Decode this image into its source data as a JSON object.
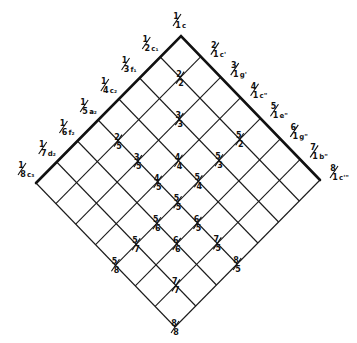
{
  "diagram": {
    "type": "diamond-lattice",
    "divisions": 7,
    "vertices": {
      "top": [
        181,
        36
      ],
      "left": [
        36,
        183
      ],
      "right": [
        320,
        180
      ],
      "bottom": [
        175,
        322
      ]
    },
    "colors": {
      "ink": "#111111",
      "background": "#ffffff"
    },
    "left_edge_labels": [
      {
        "num": "1",
        "den": "1",
        "note": "c"
      },
      {
        "num": "1",
        "den": "2",
        "note": "c₁"
      },
      {
        "num": "1",
        "den": "3",
        "note": "f₁"
      },
      {
        "num": "1",
        "den": "4",
        "note": "c₂"
      },
      {
        "num": "1",
        "den": "5",
        "note": "a̵₂"
      },
      {
        "num": "1",
        "den": "6",
        "note": "f₂"
      },
      {
        "num": "1",
        "den": "7",
        "note": "d₂"
      },
      {
        "num": "1",
        "den": "8",
        "note": "c₃"
      }
    ],
    "right_edge_labels": [
      {
        "num": "2",
        "den": "1",
        "note": "c'"
      },
      {
        "num": "3",
        "den": "1",
        "note": "g'"
      },
      {
        "num": "4",
        "den": "1",
        "note": "c\""
      },
      {
        "num": "5",
        "den": "1",
        "note": "e\""
      },
      {
        "num": "6",
        "den": "1",
        "note": "g\""
      },
      {
        "num": "7",
        "den": "1",
        "note": "b\""
      },
      {
        "num": "8",
        "den": "1",
        "note": "c'\""
      }
    ],
    "node_labels": [
      {
        "num": "2",
        "den": "2"
      },
      {
        "num": "3",
        "den": "3"
      },
      {
        "num": "4",
        "den": "4"
      },
      {
        "num": "5",
        "den": "5"
      },
      {
        "num": "6",
        "den": "6"
      },
      {
        "num": "7",
        "den": "7"
      },
      {
        "num": "8",
        "den": "8"
      },
      {
        "num": "2",
        "den": "5"
      },
      {
        "num": "3",
        "den": "5"
      },
      {
        "num": "4",
        "den": "5"
      },
      {
        "num": "6",
        "den": "5"
      },
      {
        "num": "7",
        "den": "5"
      },
      {
        "num": "8",
        "den": "5"
      },
      {
        "num": "5",
        "den": "2"
      },
      {
        "num": "5",
        "den": "3"
      },
      {
        "num": "5",
        "den": "4"
      },
      {
        "num": "5",
        "den": "6"
      },
      {
        "num": "5",
        "den": "7"
      },
      {
        "num": "5",
        "den": "8"
      }
    ]
  }
}
